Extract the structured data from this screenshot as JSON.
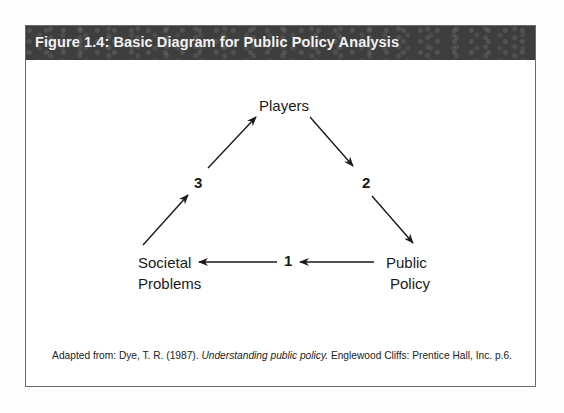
{
  "figure": {
    "title": "Figure 1.4: Basic Diagram for Public Policy Analysis"
  },
  "diagram": {
    "nodes": {
      "players": "Players",
      "public_policy_line1": "Public",
      "public_policy_line2": "Policy",
      "societal_problems_line1": "Societal",
      "societal_problems_line2": "Problems"
    },
    "steps": {
      "step1": "1",
      "step2": "2",
      "step3": "3"
    },
    "edges": [
      {
        "from": "Players",
        "to": "Public Policy",
        "label": "2"
      },
      {
        "from": "Public Policy",
        "to": "Societal Problems",
        "label": "1"
      },
      {
        "from": "Societal Problems",
        "to": "Players",
        "label": "3"
      }
    ]
  },
  "caption": {
    "prefix": "Adapted from: Dye, T. R. (1987). ",
    "title_italic": "Understanding public policy.",
    "suffix": " Englewood Cliffs: Prentice Hall, Inc. p.6."
  }
}
